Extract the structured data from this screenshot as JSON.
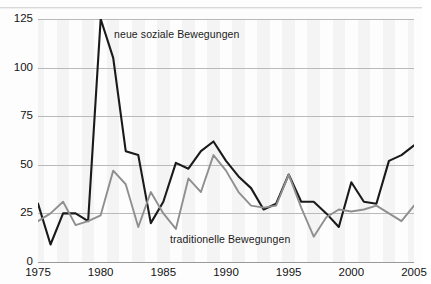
{
  "chart_data": {
    "type": "line",
    "title": "",
    "subtitle": "",
    "xlabel": "",
    "ylabel": "",
    "xlim": [
      1975,
      2005
    ],
    "ylim": [
      0,
      125
    ],
    "yticks": [
      0,
      25,
      50,
      75,
      100,
      125
    ],
    "ytick_labels": [
      "0",
      "25",
      "50",
      "75",
      "100",
      "125"
    ],
    "xticks": [
      1975,
      1980,
      1985,
      1990,
      1995,
      2000,
      2005
    ],
    "xtick_labels": [
      "1975",
      "1980",
      "1985",
      "1990",
      "1995",
      "2000",
      "2005"
    ],
    "grid": "horizontal",
    "legend_position": "inline-annotations",
    "x": [
      1975,
      1976,
      1977,
      1978,
      1979,
      1980,
      1981,
      1982,
      1983,
      1984,
      1985,
      1986,
      1987,
      1988,
      1989,
      1990,
      1991,
      1992,
      1993,
      1994,
      1995,
      1996,
      1997,
      1998,
      1999,
      2000,
      2001,
      2002,
      2003,
      2004,
      2005
    ],
    "series": [
      {
        "name": "neue soziale Bewegungen",
        "color": "#1a1a1a",
        "values": [
          30,
          9,
          25,
          25,
          21,
          125,
          105,
          57,
          55,
          20,
          31,
          51,
          48,
          57,
          62,
          52,
          44,
          38,
          27,
          30,
          45,
          31,
          31,
          25,
          18,
          41,
          31,
          30,
          52,
          55,
          60
        ]
      },
      {
        "name": "traditionelle Bewegungen",
        "color": "#8f8f8f",
        "values": [
          21,
          25,
          31,
          19,
          21,
          24,
          47,
          40,
          18,
          36,
          25,
          17,
          43,
          36,
          55,
          47,
          36,
          29,
          28,
          29,
          45,
          28,
          13,
          23,
          27,
          26,
          27,
          29,
          25,
          21,
          29
        ]
      }
    ],
    "annotations": [
      {
        "id": "nsb",
        "text": "neue soziale Bewegungen",
        "near_year": 1981,
        "near_value": 118
      },
      {
        "id": "trad",
        "text": "traditionelle Bewegungen",
        "near_year": 1987,
        "near_value": 10
      }
    ]
  }
}
